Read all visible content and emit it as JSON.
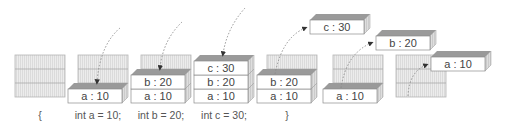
{
  "colors": {
    "slot_fill": "#e9e9e9",
    "slot_stroke": "#b5b5b5",
    "box_front": "#ffffff",
    "box_top": "#9a9a9a",
    "box_side": "#d4d4d4",
    "stroke": "#8c8c8c",
    "arrow": "#777777",
    "text": "#444444"
  },
  "stages": [
    {
      "caption": "{",
      "boxes": []
    },
    {
      "caption": "int a = 10;",
      "boxes": [
        "a : 10"
      ]
    },
    {
      "caption": "int b = 20;",
      "boxes": [
        "a : 10",
        "b : 20"
      ]
    },
    {
      "caption": "int c = 30;",
      "boxes": [
        "a : 10",
        "b : 20",
        "c : 30"
      ]
    },
    {
      "caption": "}",
      "boxes": [
        "a : 10",
        "b : 20"
      ],
      "popped": "c : 30"
    },
    {
      "caption": "",
      "boxes": [
        "a : 10"
      ],
      "popped": "b : 20"
    },
    {
      "caption": "",
      "boxes": [],
      "popped": "a : 10"
    }
  ],
  "labels": {
    "s1_a": "a : 10",
    "s2_a": "a : 10",
    "s2_b": "b : 20",
    "s3_a": "a : 10",
    "s3_b": "b : 20",
    "s3_c": "c : 30",
    "s4_a": "a : 10",
    "s4_b": "b : 20",
    "s4_c": "c : 30",
    "s5_a": "a : 10",
    "s5_b": "b : 20",
    "s6_a": "a : 10"
  },
  "captions": {
    "c0": "{",
    "c1": "int a = 10;",
    "c2": "int b = 20;",
    "c3": "int c = 30;",
    "c4": "}"
  }
}
